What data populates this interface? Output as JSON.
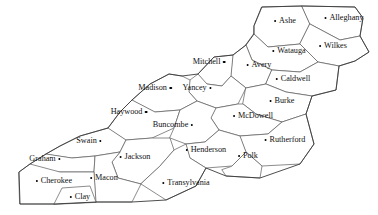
{
  "map": {
    "title": "Western North Carolina Counties",
    "region": "Western North Carolina",
    "background_color": "#ffffff",
    "boundary_color": "#5a5a5a",
    "outer_border_color": "#3a3a3a",
    "marker_color": "#000000",
    "label_color": "#111111",
    "counties": [
      {
        "name": "Ashe",
        "label_x": 285,
        "label_y": 21,
        "dot_side": "left",
        "marker_x": 273,
        "marker_y": 21
      },
      {
        "name": "Alleghany",
        "label_x": 344,
        "label_y": 18,
        "dot_side": "left",
        "marker_x": 316,
        "marker_y": 18
      },
      {
        "name": "Watauga",
        "label_x": 289,
        "label_y": 51,
        "dot_side": "left",
        "marker_x": 266,
        "marker_y": 51
      },
      {
        "name": "Wilkes",
        "label_x": 333,
        "label_y": 46,
        "dot_side": "left",
        "marker_x": 313,
        "marker_y": 46
      },
      {
        "name": "Mitchell",
        "label_x": 209,
        "label_y": 62,
        "dot_side": "right",
        "marker_x": 228,
        "marker_y": 63
      },
      {
        "name": "Avery",
        "label_x": 259,
        "label_y": 65,
        "dot_side": "left",
        "marker_x": 242,
        "marker_y": 65
      },
      {
        "name": "Caldwell",
        "label_x": 293,
        "label_y": 79,
        "dot_side": "left",
        "marker_x": 268,
        "marker_y": 79
      },
      {
        "name": "Madison",
        "label_x": 155,
        "label_y": 88,
        "dot_side": "right",
        "marker_x": 172,
        "marker_y": 89
      },
      {
        "name": "Yancey",
        "label_x": 197,
        "label_y": 88,
        "dot_side": "right",
        "marker_x": 215,
        "marker_y": 89
      },
      {
        "name": "Haywood",
        "label_x": 129,
        "label_y": 112,
        "dot_side": "right",
        "marker_x": 147,
        "marker_y": 113
      },
      {
        "name": "Burke",
        "label_x": 282,
        "label_y": 101,
        "dot_side": "left",
        "marker_x": 263,
        "marker_y": 101
      },
      {
        "name": "McDowell",
        "label_x": 253,
        "label_y": 116,
        "dot_side": "left",
        "marker_x": 229,
        "marker_y": 116
      },
      {
        "name": "Buncombe",
        "label_x": 173,
        "label_y": 125,
        "dot_side": "right",
        "marker_x": 197,
        "marker_y": 125
      },
      {
        "name": "Rutherford",
        "label_x": 285,
        "label_y": 140,
        "dot_side": "left",
        "marker_x": 258,
        "marker_y": 140
      },
      {
        "name": "Swain",
        "label_x": 89,
        "label_y": 141,
        "dot_side": "right",
        "marker_x": 105,
        "marker_y": 141
      },
      {
        "name": "Jackson",
        "label_x": 135,
        "label_y": 157,
        "dot_side": "left",
        "marker_x": 119,
        "marker_y": 156
      },
      {
        "name": "Henderson",
        "label_x": 206,
        "label_y": 150,
        "dot_side": "left",
        "marker_x": 188,
        "marker_y": 150
      },
      {
        "name": "Polk",
        "label_x": 248,
        "label_y": 156,
        "dot_side": "left",
        "marker_x": 237,
        "marker_y": 156
      },
      {
        "name": "Graham",
        "label_x": 45,
        "label_y": 159,
        "dot_side": "right",
        "marker_x": 66,
        "marker_y": 159
      },
      {
        "name": "Macon",
        "label_x": 104,
        "label_y": 178,
        "dot_side": "left",
        "marker_x": 88,
        "marker_y": 178
      },
      {
        "name": "Cherokee",
        "label_x": 54,
        "label_y": 181,
        "dot_side": "left",
        "marker_x": 31,
        "marker_y": 181
      },
      {
        "name": "Transylvania",
        "label_x": 186,
        "label_y": 183,
        "dot_side": "left",
        "marker_x": 155,
        "marker_y": 183
      },
      {
        "name": "Clay",
        "label_x": 80,
        "label_y": 197,
        "dot_side": "left",
        "marker_x": 66,
        "marker_y": 197
      }
    ]
  },
  "geometry": {
    "county_paths": [
      {
        "name": "ashe",
        "d": "M 254 26 L 262 7 L 302 6 L 310 24 L 300 44 L 268 47 L 254 34 Z"
      },
      {
        "name": "alleghany",
        "d": "M 302 6 L 355 7 L 363 18 L 360 36 L 340 40 L 310 24 Z"
      },
      {
        "name": "wilkes",
        "d": "M 310 24 L 340 40 L 360 36 L 369 52 L 355 61 L 339 66 L 318 62 L 300 44 Z"
      },
      {
        "name": "watauga",
        "d": "M 254 34 L 268 47 L 300 44 L 318 62 L 300 72 L 272 70 L 252 60 L 246 45 Z"
      },
      {
        "name": "avery",
        "d": "M 233 55 L 246 45 L 252 60 L 272 70 L 266 84 L 246 88 L 231 76 Z"
      },
      {
        "name": "caldwell",
        "d": "M 272 70 L 300 72 L 318 62 L 339 66 L 336 90 L 312 96 L 286 92 L 266 84 Z"
      },
      {
        "name": "mitchell",
        "d": "M 198 74 L 214 57 L 233 55 L 231 76 L 222 86 L 207 84 Z"
      },
      {
        "name": "yancey",
        "d": "M 190 80 L 198 74 L 207 84 L 222 86 L 231 76 L 246 88 L 238 104 L 216 108 L 197 101 L 189 92 Z"
      },
      {
        "name": "madison",
        "d": "M 132 100 L 150 84 L 169 74 L 182 76 L 190 80 L 189 92 L 197 101 L 180 110 L 155 112 Z"
      },
      {
        "name": "burke",
        "d": "M 246 88 L 266 84 L 286 92 L 312 96 L 306 114 L 282 122 L 256 114 L 243 104 Z"
      },
      {
        "name": "mcdowell",
        "d": "M 216 108 L 238 104 L 243 104 L 256 114 L 282 122 L 268 134 L 240 136 L 219 130 L 211 118 Z"
      },
      {
        "name": "haywood",
        "d": "M 108 128 L 120 112 L 132 100 L 155 112 L 180 110 L 174 128 L 152 138 L 126 140 Z"
      },
      {
        "name": "buncombe",
        "d": "M 174 128 L 180 110 L 197 101 L 216 108 L 211 118 L 219 130 L 205 142 L 186 144 L 170 138 Z"
      },
      {
        "name": "rutherford",
        "d": "M 240 136 L 268 134 L 282 122 L 306 114 L 314 144 L 300 164 L 262 166 L 246 152 Z"
      },
      {
        "name": "henderson",
        "d": "M 186 144 L 205 142 L 219 130 L 240 136 L 246 152 L 232 166 L 206 168 L 190 158 Z"
      },
      {
        "name": "polk",
        "d": "M 232 166 L 246 152 L 262 166 L 260 178 L 226 176 L 222 170 Z"
      },
      {
        "name": "swain",
        "d": "M 46 154 L 60 146 L 80 136 L 108 128 L 126 140 L 120 152 L 95 156 L 72 158 Z"
      },
      {
        "name": "jackson",
        "d": "M 120 152 L 126 140 L 152 138 L 170 138 L 174 150 L 160 166 L 141 184 L 118 178 L 112 162 Z"
      },
      {
        "name": "transylvania",
        "d": "M 160 166 L 174 150 L 186 144 L 190 158 L 206 168 L 196 186 L 166 200 L 141 184 Z"
      },
      {
        "name": "graham",
        "d": "M 30 164 L 46 154 L 72 158 L 95 156 L 94 172 L 60 172 L 30 172 Z"
      },
      {
        "name": "macon",
        "d": "M 94 172 L 95 156 L 120 152 L 112 162 L 118 178 L 141 184 L 132 202 L 96 202 Z"
      },
      {
        "name": "cherokee",
        "d": "M 19 172 L 30 164 L 60 172 L 94 172 L 96 202 L 54 204 L 20 204 Z"
      },
      {
        "name": "clay",
        "d": "M 54 204 L 62 188 L 90 186 L 96 202 Z"
      }
    ],
    "outer_border": "M 262 7 L 302 6 L 355 7 L 363 18 L 360 36 L 369 52 L 355 61 L 339 66 L 336 90 L 312 96 L 306 114 L 314 144 L 300 164 L 260 178 L 226 176 L 206 168 L 196 186 L 166 200 L 132 202 L 96 202 L 54 204 L 20 204 L 19 172 L 30 164 L 46 154 L 60 146 L 80 136 L 108 128 L 120 112 L 132 100 L 150 84 L 169 74 L 182 76 L 198 74 L 214 57 L 233 55 L 246 45 L 254 34 L 254 26 Z"
  }
}
